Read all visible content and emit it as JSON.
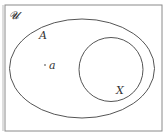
{
  "diagram": {
    "type": "venn",
    "universe_label": "𝓤",
    "set_a_label": "A",
    "set_x_label": "X",
    "element_label": "a",
    "colors": {
      "stroke": "#555555",
      "frame": "#888888",
      "background": "#ffffff"
    }
  }
}
